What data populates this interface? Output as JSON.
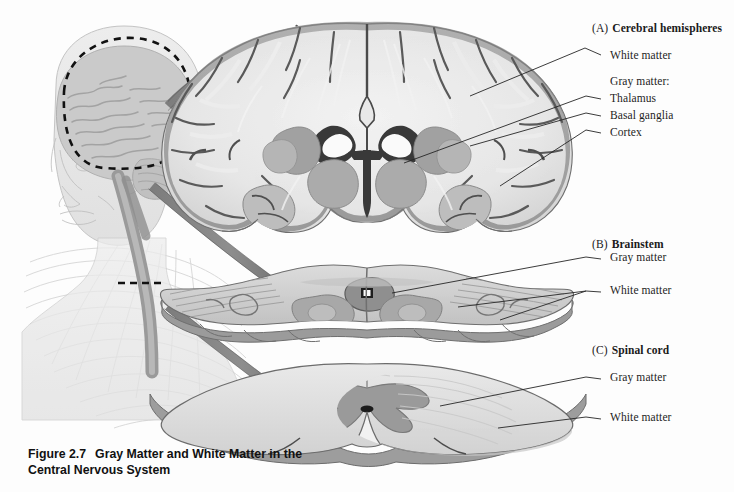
{
  "figure": {
    "number": "Figure 2.7",
    "title": "Gray Matter and White Matter in the Central Nervous System",
    "caption_line1": "Gray Matter and White Matter in",
    "caption_line2": "the Central Nervous System"
  },
  "panels": [
    {
      "letter": "(A)",
      "title": "Cerebral hemispheres",
      "labels": [
        {
          "text": "White matter"
        },
        {
          "text": "Gray matter:"
        },
        {
          "text": "Thalamus"
        },
        {
          "text": "Basal ganglia"
        },
        {
          "text": "Cortex"
        }
      ]
    },
    {
      "letter": "(B)",
      "title": "Brainstem",
      "labels": [
        {
          "text": "Gray matter"
        },
        {
          "text": "White matter"
        }
      ]
    },
    {
      "letter": "(C)",
      "title": "Spinal cord",
      "labels": [
        {
          "text": "Gray matter"
        },
        {
          "text": "White matter"
        }
      ]
    }
  ],
  "overview": {
    "description": "Human head and upper body with brain, brainstem, spinal cord and peripheral nerves",
    "markers": [
      {
        "name": "cerebrum-dashed-oval"
      },
      {
        "name": "spinal-cord-dashed-level"
      }
    ]
  },
  "colors": {
    "background": "#fdfdfd",
    "arrow_fill": "#8d8d8d",
    "arrow_stroke": "#4a4a4a",
    "gray_matter": "#9a9a9a",
    "white_matter": "#e6e6e6",
    "leader_line": "#2b2b2b",
    "text": "#1a1a1a",
    "body_outline": "#b9b9b9"
  }
}
